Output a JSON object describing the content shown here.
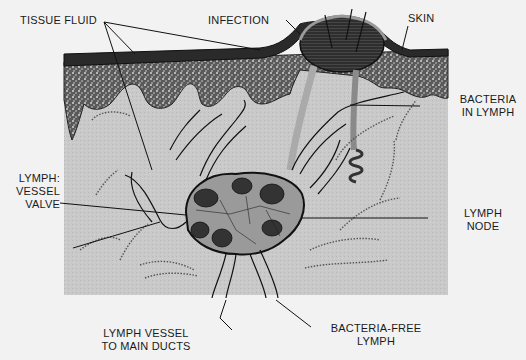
{
  "diagram": {
    "colors": {
      "background": "#f2f2f2",
      "tissue": "#c8c8c8",
      "skin_dark": "#2a2a2a",
      "infection": "#3a3a3a",
      "outline": "#111111"
    },
    "labels": {
      "tissue_fluid": "TISSUE FLUID",
      "infection": "INFECTION",
      "skin": "SKIN",
      "bacteria_in_lymph_1": "BACTERIA",
      "bacteria_in_lymph_2": "IN LYMPH",
      "lymph_1": "LYMPH:",
      "vessel": "VESSEL",
      "valve": "VALVE",
      "lymph_node_1": "LYMPH",
      "lymph_node_2": "NODE",
      "lymph_vessel_1": "LYMPH VESSEL",
      "lymph_vessel_2": "TO MAIN DUCTS",
      "bacteria_free_1": "BACTERIA-FREE",
      "bacteria_free_2": "LYMPH"
    }
  }
}
